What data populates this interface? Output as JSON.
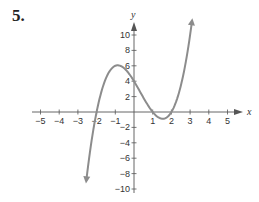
{
  "problem": {
    "number": "5."
  },
  "chart_data": {
    "type": "line",
    "title": "",
    "xlabel": "x",
    "ylabel": "y",
    "xlim": [
      -5,
      5
    ],
    "ylim": [
      -10,
      10
    ],
    "x_ticks": [
      -5,
      -4,
      -3,
      -2,
      -1,
      1,
      2,
      3,
      4,
      5
    ],
    "x_tick_labels": [
      "−5",
      "−4",
      "−3",
      "−2",
      "−1",
      "1",
      "2",
      "3",
      "4",
      "5"
    ],
    "y_ticks": [
      10,
      8,
      6,
      4,
      2,
      -2,
      -4,
      -6,
      -8,
      -10
    ],
    "y_tick_labels": [
      "10",
      "8",
      "6",
      "4",
      "2",
      "−2",
      "−4",
      "−6",
      "−8",
      "−10"
    ],
    "grid": false,
    "legend": null,
    "series": [
      {
        "name": "f(x)",
        "description": "cubic polynomial with arrows at both ends",
        "x_intercepts": [
          -2,
          1,
          2
        ],
        "y_intercept": 4,
        "local_max": [
          -1,
          6
        ],
        "local_min": [
          1.55,
          -0.9
        ],
        "points": [
          [
            -2.55,
            -8.9
          ],
          [
            -2.4,
            -5.4
          ],
          [
            -2.2,
            -2.4
          ],
          [
            -2.0,
            0.0
          ],
          [
            -1.8,
            2.0
          ],
          [
            -1.5,
            4.4
          ],
          [
            -1.2,
            5.7
          ],
          [
            -1.0,
            6.0
          ],
          [
            -0.8,
            5.9
          ],
          [
            -0.5,
            5.4
          ],
          [
            0.0,
            4.0
          ],
          [
            0.5,
            1.9
          ],
          [
            1.0,
            0.0
          ],
          [
            1.3,
            -0.7
          ],
          [
            1.55,
            -0.9
          ],
          [
            1.8,
            -0.6
          ],
          [
            2.0,
            0.0
          ],
          [
            2.3,
            1.4
          ],
          [
            2.6,
            3.7
          ],
          [
            2.9,
            7.2
          ],
          [
            3.1,
            11.0
          ]
        ],
        "color": "#8c8c8c"
      }
    ]
  }
}
